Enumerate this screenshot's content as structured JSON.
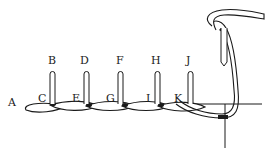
{
  "diagram": {
    "type": "embroidery-stitch-diagram",
    "colors": {
      "line": "#1a1a1a",
      "thread_fill": "#ffffff",
      "background": "#ffffff"
    },
    "labels": {
      "A": "A",
      "B": "B",
      "C": "C",
      "D": "D",
      "E": "E",
      "F": "F",
      "G": "G",
      "H": "H",
      "I": "I",
      "J": "J",
      "K": "K"
    }
  }
}
